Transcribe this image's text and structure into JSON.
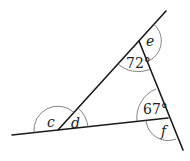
{
  "diagram": {
    "type": "geometry-triangle-angles",
    "labels": {
      "c": "c",
      "d": "d",
      "e": "e",
      "f": "f",
      "angle_top": "72°",
      "angle_right": "67°"
    },
    "given_angles": {
      "top_interior": 72,
      "right_interior": 67
    },
    "unknown_angles": [
      "c",
      "d",
      "e",
      "f"
    ],
    "colors": {
      "lines": "#1a1a1a",
      "arcs": "#666666",
      "text": "#222222",
      "background": "#ffffff"
    }
  }
}
